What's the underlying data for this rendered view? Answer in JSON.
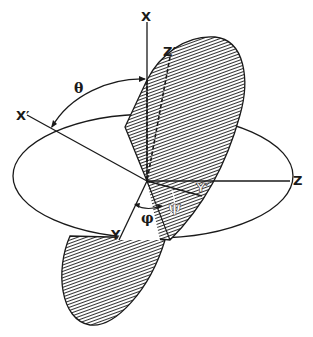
{
  "figure": {
    "labels": {
      "x": "X",
      "x_prime": "X′",
      "z": "Z",
      "z_prime": "Z′",
      "y": "Y",
      "y_prime": "Y′",
      "theta": "θ",
      "phi": "φ",
      "psi": "ψ"
    },
    "colors": {
      "ink": "#1a1a1a",
      "background": "#ffffff"
    }
  }
}
